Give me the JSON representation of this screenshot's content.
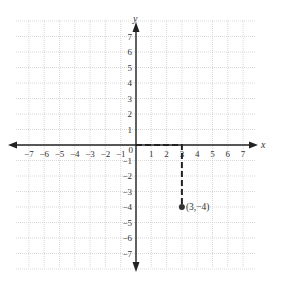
{
  "chart_data": {
    "type": "scatter",
    "title": "",
    "xlabel": "x",
    "ylabel": "y",
    "xlim": [
      -7.8,
      7.8
    ],
    "ylim": [
      -7.8,
      7.8
    ],
    "grid": true,
    "x_ticks": [
      -7,
      -6,
      -5,
      -4,
      -3,
      -2,
      -1,
      0,
      1,
      2,
      3,
      4,
      5,
      6,
      7
    ],
    "y_ticks": [
      -7,
      -6,
      -5,
      -4,
      -3,
      -2,
      -1,
      1,
      2,
      3,
      4,
      5,
      6,
      7
    ],
    "x_tick_labels": [
      "−7",
      "−6",
      "−5",
      "−4",
      "−3",
      "−2",
      "−1",
      "0",
      "1",
      "2",
      "3",
      "4",
      "5",
      "6",
      "7"
    ],
    "y_tick_labels": [
      "−7",
      "−6",
      "−5",
      "−4",
      "−3",
      "−2",
      "−1",
      "1",
      "2",
      "3",
      "4",
      "5",
      "6",
      "7"
    ],
    "points": [
      {
        "x": 3,
        "y": -4,
        "label": "(3, −4)"
      }
    ],
    "annotations": [
      {
        "type": "dashed-path",
        "description": "Dashed path from origin right along x-axis to (3,0) then down to (3,−4)",
        "path": [
          [
            0,
            0
          ],
          [
            3,
            0
          ],
          [
            3,
            -4
          ]
        ]
      }
    ],
    "legend": null
  },
  "labels": {
    "x_axis": "x",
    "y_axis": "y",
    "origin": "0",
    "point": "(3,−4)"
  },
  "colors": {
    "axis": "#222222",
    "grid": "#c8c8c8",
    "point": "#333333",
    "dash": "#222222"
  }
}
